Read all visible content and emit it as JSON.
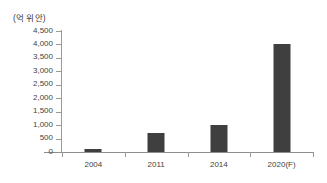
{
  "chart_data": {
    "type": "bar",
    "title": "",
    "subtitle": "",
    "unit_label": "(억 위안)",
    "xlabel": "",
    "ylabel": "",
    "categories": [
      "2004",
      "2011",
      "2014",
      "2020(F)"
    ],
    "values": [
      100,
      700,
      1000,
      4000
    ],
    "series": [
      {
        "name": "",
        "values": [
          100,
          700,
          1000,
          4000
        ]
      }
    ],
    "ylim": [
      0,
      4500
    ],
    "ytick_step": 500,
    "ytick_labels": [
      "4,500",
      "4,000",
      "3,500",
      "3,000",
      "2,500",
      "2,000",
      "1,500",
      "1,000",
      "500",
      "0"
    ],
    "ytick_values": [
      4500,
      4000,
      3500,
      3000,
      2500,
      2000,
      1500,
      1000,
      500,
      0
    ],
    "grid": false,
    "legend": false,
    "legend_position": "none",
    "bar_color": "#3f3f3f",
    "axis_color": "#9a9a9a",
    "text_color": "#3f3f3f",
    "background_color": "#ffffff",
    "annotations": []
  }
}
